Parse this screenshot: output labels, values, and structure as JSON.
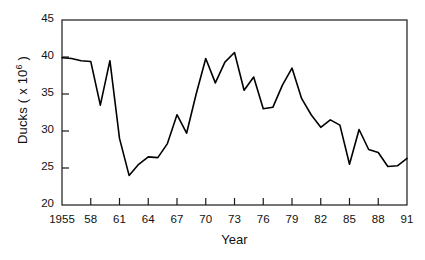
{
  "chart_data": {
    "type": "line",
    "title": "",
    "xlabel": "Year",
    "ylabel": "Ducks ( x 10^6 )",
    "ylabel_text": "Ducks ( x 10",
    "ylabel_exponent": "6",
    "ylabel_tail": " )",
    "xlim": [
      1955,
      1991
    ],
    "ylim": [
      20,
      45
    ],
    "grid": false,
    "legend": null,
    "yticks": [
      20,
      25,
      30,
      35,
      40,
      45
    ],
    "ytick_labels": [
      "20",
      "25",
      "30",
      "35",
      "40",
      "45"
    ],
    "xticks": [
      1955,
      1958,
      1961,
      1964,
      1967,
      1970,
      1973,
      1976,
      1979,
      1982,
      1985,
      1988,
      1991
    ],
    "xtick_labels": [
      "1955",
      "58",
      "61",
      "64",
      "67",
      "70",
      "73",
      "76",
      "79",
      "82",
      "85",
      "88",
      "91"
    ],
    "series": [
      {
        "name": "Ducks",
        "color": "#000000",
        "x": [
          1955,
          1956,
          1957,
          1958,
          1959,
          1960,
          1961,
          1962,
          1963,
          1964,
          1965,
          1966,
          1967,
          1968,
          1969,
          1970,
          1971,
          1972,
          1973,
          1974,
          1975,
          1976,
          1977,
          1978,
          1979,
          1980,
          1981,
          1982,
          1983,
          1984,
          1985,
          1986,
          1987,
          1988,
          1989,
          1990,
          1991
        ],
        "values": [
          39.9,
          39.8,
          39.5,
          39.4,
          33.5,
          39.5,
          29.0,
          24.0,
          25.5,
          26.5,
          26.4,
          28.3,
          32.2,
          29.7,
          35.0,
          39.8,
          36.5,
          39.3,
          40.6,
          35.5,
          37.3,
          33.0,
          33.2,
          36.2,
          38.5,
          34.4,
          32.2,
          30.5,
          31.5,
          30.8,
          25.5,
          30.2,
          27.5,
          27.1,
          25.2,
          25.3,
          26.3
        ]
      }
    ]
  },
  "axes": {
    "frame_color": "#1a1a1a",
    "line_color": "#000000"
  }
}
